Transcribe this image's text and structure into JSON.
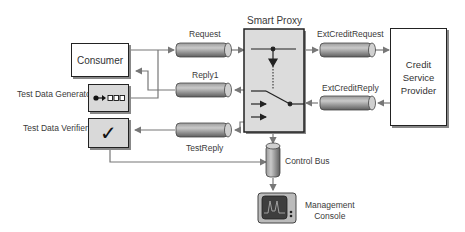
{
  "title": "Smart Proxy",
  "nodes": {
    "consumer": "Consumer",
    "test_data_generator": "Test Data Generator",
    "test_data_verifier": "Test Data Verifier",
    "credit_service": [
      "Credit",
      "Service",
      "Provider"
    ],
    "management_console": [
      "Management",
      "Console"
    ],
    "verifier_glyph": "✓"
  },
  "channels": {
    "request": "Request",
    "reply1": "Reply1",
    "test_reply": "TestReply",
    "ext_credit_request": "ExtCreditRequest",
    "ext_credit_reply": "ExtCreditReply",
    "control_bus": "Control Bus"
  },
  "colors": {
    "line": "#777777",
    "box_border": "#222222",
    "proxy_fill": "#dcdcdc",
    "pipe_dark": "#6b6b6b",
    "pipe_light": "#c8c8c8"
  }
}
